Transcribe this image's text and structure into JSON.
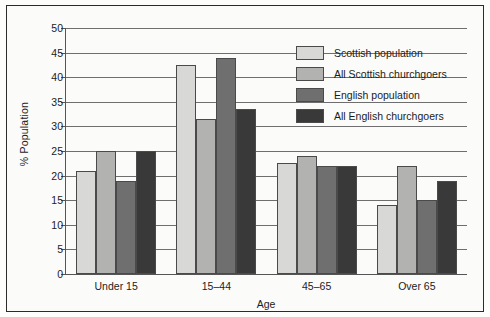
{
  "chart_data": {
    "type": "bar",
    "title": "",
    "xlabel": "Age",
    "ylabel": "% Population",
    "categories": [
      "Under 15",
      "15–44",
      "45–65",
      "Over 65"
    ],
    "series": [
      {
        "name": "Scottish population",
        "color": "#d8d8d6",
        "values": [
          21,
          42.5,
          22.5,
          14
        ]
      },
      {
        "name": "All Scottish churchgoers",
        "color": "#b2b2b0",
        "values": [
          25,
          31.5,
          24,
          22
        ]
      },
      {
        "name": "English population",
        "color": "#6f6f6f",
        "values": [
          19,
          44,
          22,
          15
        ]
      },
      {
        "name": "All English churchgoers",
        "color": "#393939",
        "values": [
          25,
          33.5,
          22,
          19
        ]
      }
    ],
    "ylim": [
      0,
      50
    ],
    "ytick_step": 5,
    "yticks": [
      0,
      5,
      10,
      15,
      20,
      25,
      30,
      35,
      40,
      45,
      50
    ],
    "ytick_labels": [
      "0",
      "5",
      "10",
      "15",
      "20",
      "25",
      "30",
      "35",
      "40",
      "45",
      "50"
    ],
    "grid": true,
    "legend_position": "top-right"
  }
}
